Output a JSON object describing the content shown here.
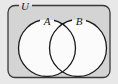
{
  "figure": {
    "name": "venn-diagram-two-sets",
    "type": "set-diagram",
    "width": 118,
    "height": 84
  },
  "colors": {
    "page_background": "#ffffff",
    "outer_background": "#e8e8e8",
    "universe_fill": "#d4d4d4",
    "universe_stroke": "#3a3a3a",
    "circle_fill": "#fbfbfb",
    "circle_stroke": "#1a1a1a",
    "label_color": "#1a1a1a"
  },
  "universe": {
    "label": "U",
    "shape": "rounded-rectangle",
    "x": 8,
    "y": 5.5,
    "width": 102,
    "height": 72,
    "corner_radius": 7,
    "label_x": 25,
    "label_y": 10,
    "label_font_size": 11,
    "gap_start_x": 19,
    "gap_end_x": 32
  },
  "sets": [
    {
      "label": "A",
      "cx": 47,
      "cy": 48,
      "r": 28.5,
      "label_x": 47,
      "label_y": 25,
      "label_font_size": 11,
      "gap_half_width": 7
    },
    {
      "label": "B",
      "cx": 78,
      "cy": 48,
      "r": 28.5,
      "label_x": 79,
      "label_y": 25,
      "label_font_size": 11,
      "gap_half_width": 7
    }
  ],
  "chart_data": {
    "type": "diagram",
    "title": "",
    "regions": [
      {
        "name": "A only",
        "shaded": false
      },
      {
        "name": "A intersect B",
        "shaded": false
      },
      {
        "name": "B only",
        "shaded": false
      },
      {
        "name": "U outside A and B",
        "shaded": true
      }
    ]
  }
}
